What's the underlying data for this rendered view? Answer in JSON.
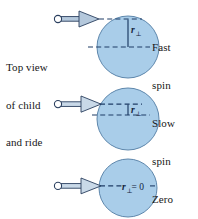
{
  "figure": {
    "background_color": "#ffffff",
    "disk_fill_color": "#a9cde9",
    "disk_stroke_color": "#5b86ad",
    "dash_color": "#1f3d66",
    "arrow_fill_color": "#b9cde0",
    "arrow_stroke_color": "#2a3f5f",
    "left_caption": {
      "line1": "Top view",
      "line2": "of child",
      "line3": "and ride"
    },
    "panels": [
      {
        "id": "fast",
        "label_line1": "Fast",
        "label_line2": "spin",
        "radius_label": "r",
        "radius_subscript": "⊥",
        "radius_value_text": "",
        "disk_cx": 128,
        "disk_cy": 47,
        "disk_r": 31,
        "arrow_y": 19,
        "offset_line_y": 19,
        "center_line_y": 47
      },
      {
        "id": "slow",
        "label_line1": "Slow",
        "label_line2": "spin",
        "radius_label": "r",
        "radius_subscript": "⊥",
        "radius_value_text": "",
        "disk_cx": 128,
        "disk_cy": 119,
        "disk_r": 31,
        "arrow_y": 104,
        "offset_line_y": 104,
        "center_line_y": 115
      },
      {
        "id": "zero",
        "label_line1": "Zero",
        "label_line2": "spin",
        "radius_label": "r",
        "radius_subscript": "⊥",
        "radius_value_text": "= 0",
        "disk_cx": 128,
        "disk_cy": 188,
        "disk_r": 29,
        "arrow_y": 186,
        "offset_line_y": 186,
        "center_line_y": 186
      }
    ],
    "equation_zero": "= 0"
  }
}
